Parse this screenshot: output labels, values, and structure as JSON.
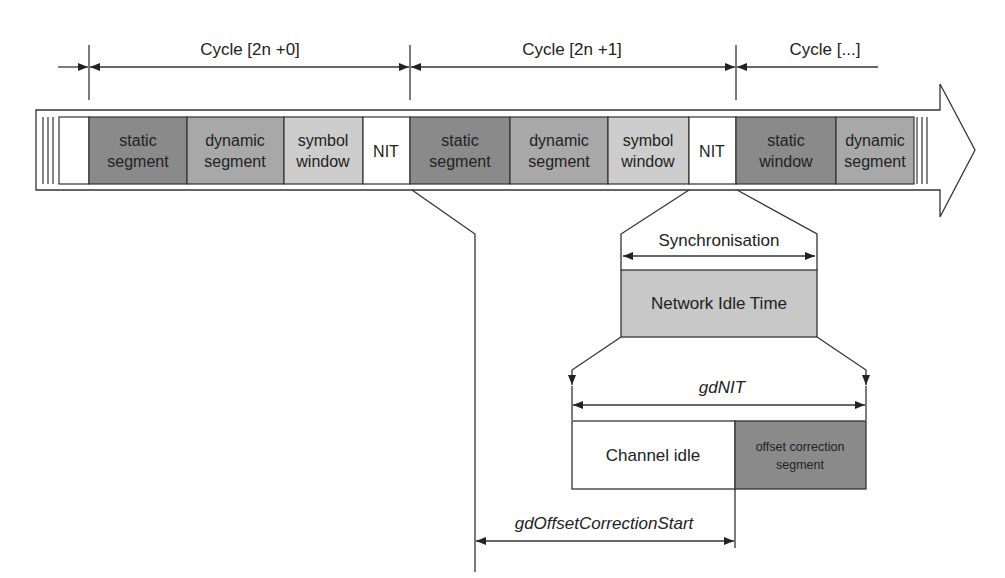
{
  "cycles": [
    {
      "label": "Cycle [2n +0]"
    },
    {
      "label": "Cycle [2n +1]"
    },
    {
      "label": "Cycle [...]"
    }
  ],
  "segments": [
    {
      "line1": "static",
      "line2": "segment",
      "color": "#8a8a8a"
    },
    {
      "line1": "dynamic",
      "line2": "segment",
      "color": "#a8a8a8"
    },
    {
      "line1": "symbol",
      "line2": "window",
      "color": "#cdcdcd"
    },
    {
      "line1": "NIT",
      "line2": "",
      "color": "#ffffff"
    },
    {
      "line1": "static",
      "line2": "segment",
      "color": "#8a8a8a"
    },
    {
      "line1": "dynamic",
      "line2": "segment",
      "color": "#a8a8a8"
    },
    {
      "line1": "symbol",
      "line2": "window",
      "color": "#cdcdcd"
    },
    {
      "line1": "NIT",
      "line2": "",
      "color": "#ffffff"
    },
    {
      "line1": "static",
      "line2": "window",
      "color": "#8a8a8a"
    },
    {
      "line1": "dynamic",
      "line2": "segment",
      "color": "#a8a8a8"
    }
  ],
  "synchronisation": {
    "label": "Synchronisation"
  },
  "nit_box": {
    "label": "Network Idle Time",
    "color": "#c8c8c8"
  },
  "gdnit": {
    "label": "gdNIT"
  },
  "channel_idle": {
    "label": "Channel idle"
  },
  "offset_correction": {
    "line1": "offset correction",
    "line2": "segment",
    "color": "#8a8a8a"
  },
  "gd_offset_correction_start": {
    "label": "gdOffsetCorrectionStart"
  }
}
